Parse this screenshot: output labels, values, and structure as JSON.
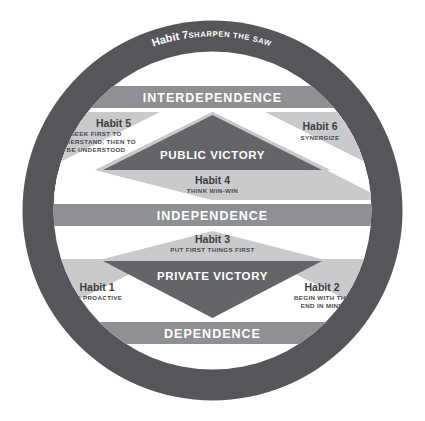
{
  "diagram": {
    "colors": {
      "ring": "#56565a",
      "band": "#8e9094",
      "light_panel": "#c9cacb",
      "dark_triangle": "#646569",
      "background": "#ffffff",
      "label_light": "#ffffff",
      "label_dark": "#3d3d40"
    },
    "outer_ring": {
      "habit_number": "Habit 7",
      "habit_name": "SHARPEN THE SAW"
    },
    "stages": [
      {
        "id": "interdependence",
        "label": "INTERDEPENDENCE"
      },
      {
        "id": "independence",
        "label": "INDEPENDENCE"
      },
      {
        "id": "dependence",
        "label": "DEPENDENCE"
      }
    ],
    "victories": [
      {
        "id": "public-victory",
        "label": "PUBLIC VICTORY"
      },
      {
        "id": "private-victory",
        "label": "PRIVATE VICTORY"
      }
    ],
    "habits": [
      {
        "id": "habit-1",
        "number": "Habit 1",
        "lines": [
          "BE PROACTIVE"
        ],
        "group": "private-victory"
      },
      {
        "id": "habit-2",
        "number": "Habit 2",
        "lines": [
          "BEGIN WITH THE",
          "END IN MIND"
        ],
        "group": "private-victory"
      },
      {
        "id": "habit-3",
        "number": "Habit 3",
        "lines": [
          "PUT FIRST THINGS FIRST"
        ],
        "group": "private-victory"
      },
      {
        "id": "habit-4",
        "number": "Habit 4",
        "lines": [
          "THINK WIN-WIN"
        ],
        "group": "public-victory"
      },
      {
        "id": "habit-5",
        "number": "Habit 5",
        "lines": [
          "SEEK FIRST TO",
          "UNDERSTAND, THEN TO",
          "BE UNDERSTOOD"
        ],
        "group": "public-victory"
      },
      {
        "id": "habit-6",
        "number": "Habit 6",
        "lines": [
          "SYNERGIZE"
        ],
        "group": "public-victory"
      },
      {
        "id": "habit-7",
        "number": "Habit 7",
        "lines": [
          "SHARPEN THE SAW"
        ],
        "group": "renewal"
      }
    ]
  }
}
